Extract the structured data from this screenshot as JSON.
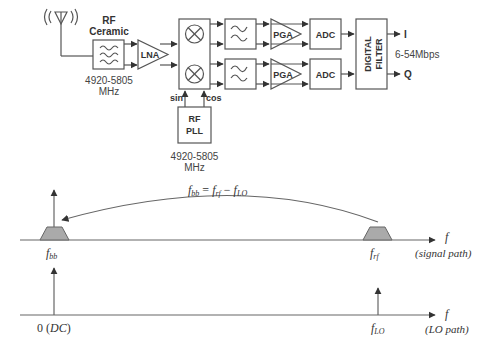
{
  "block_diagram": {
    "antenna": {
      "icon": "antenna-icon"
    },
    "rf_filter": {
      "title_line1": "RF",
      "title_line2": "Ceramic",
      "freq_line1": "4920-5805",
      "freq_line2": "MHz"
    },
    "lna": {
      "label": "LNA"
    },
    "mixer": {
      "top_icon": "multiplier-icon",
      "bottom_icon": "multiplier-icon",
      "sin_label": "sin",
      "cos_label": "cos"
    },
    "rf_pll": {
      "line1": "RF",
      "line2": "PLL",
      "freq_line1": "4920-5805",
      "freq_line2": "MHz"
    },
    "channels": [
      {
        "lpf_icon": "lowpass-filter-icon",
        "pga": "PGA",
        "adc": "ADC",
        "output": "I"
      },
      {
        "lpf_icon": "lowpass-filter-icon",
        "pga": "PGA",
        "adc": "ADC",
        "output": "Q"
      }
    ],
    "digital_filter": {
      "line1": "DIGITAL",
      "line2": "FILTER"
    },
    "data_rate": "6-54Mbps"
  },
  "spectrum_signal": {
    "equation": {
      "lhs": "f",
      "lhs_sub": "bb",
      "eq": " = ",
      "t1": "f",
      "t1_sub": "rf",
      "minus": " − ",
      "t2": "f",
      "t2_sub": "LO"
    },
    "axis_label": "f",
    "path_label": "(signal path)",
    "fbb_label": "f",
    "fbb_sub": "bb",
    "frf_label": "f",
    "frf_sub": "rf"
  },
  "spectrum_lo": {
    "axis_label": "f",
    "path_label": "(LO path)",
    "dc_label_num": "0 (",
    "dc_label_it": "DC",
    "dc_label_end": ")",
    "flo_label": "f",
    "flo_sub": "LO"
  }
}
